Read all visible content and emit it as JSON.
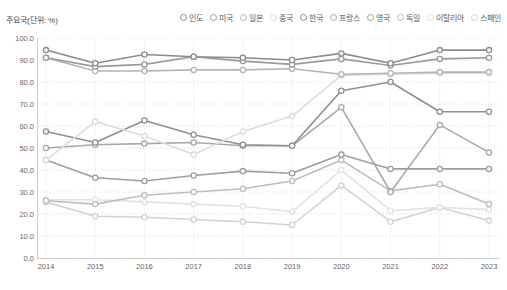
{
  "chart_title": "주요국(단위: %)",
  "legend": {
    "position": "top-right",
    "entries": [
      {
        "label": "인도",
        "color": "#8c8c8c"
      },
      {
        "label": "미국",
        "color": "#9a9a9a"
      },
      {
        "label": "일본",
        "color": "#b4b4b4"
      },
      {
        "label": "중국",
        "color": "#dcdcdc"
      },
      {
        "label": "한국",
        "color": "#8f8f8f"
      },
      {
        "label": "프랑스",
        "color": "#a8a8a8"
      },
      {
        "label": "영국",
        "color": "#9e9e9e"
      },
      {
        "label": "독일",
        "color": "#bdbdbd"
      },
      {
        "label": "이탈리아",
        "color": "#e2e2e2"
      },
      {
        "label": "스페인",
        "color": "#d2d2d2"
      }
    ]
  },
  "chart_data": {
    "type": "line",
    "title": "주요국(단위: %)",
    "xlabel": "",
    "ylabel": "",
    "ylim": [
      0,
      100
    ],
    "yticks": [
      "100.0",
      "90.0",
      "80.0",
      "70.0",
      "60.0",
      "50.0",
      "40.0",
      "30.0",
      "20.0",
      "10.0",
      "0.0"
    ],
    "grid": true,
    "categories": [
      "2014",
      "2015",
      "2016",
      "2017",
      "2018",
      "2019",
      "2020",
      "2021",
      "2022",
      "2023"
    ],
    "x": [
      2014,
      2015,
      2016,
      2017,
      2018,
      2019,
      2020,
      2021,
      2022,
      2023
    ],
    "series": [
      {
        "name": "인도",
        "color": "#8c8c8c",
        "values": [
          94.5,
          88.5,
          92.5,
          91.5,
          91.0,
          90.0,
          93.0,
          88.5,
          94.5,
          94.5
        ]
      },
      {
        "name": "미국",
        "color": "#9a9a9a",
        "values": [
          91.0,
          87.0,
          88.0,
          91.5,
          89.5,
          88.0,
          90.5,
          87.5,
          90.5,
          91.0
        ]
      },
      {
        "name": "일본",
        "color": "#b4b4b4",
        "values": [
          91.0,
          85.0,
          85.0,
          85.5,
          85.5,
          86.0,
          83.5,
          84.0,
          84.5,
          84.5
        ]
      },
      {
        "name": "중국",
        "color": "#dcdcdc",
        "values": [
          44.5,
          62.0,
          55.5,
          47.0,
          57.5,
          64.5,
          83.0,
          83.5,
          84.0,
          84.0
        ]
      },
      {
        "name": "한국",
        "color": "#8f8f8f",
        "values": [
          57.5,
          52.5,
          62.5,
          56.0,
          51.5,
          51.0,
          76.0,
          80.0,
          66.5,
          66.5
        ]
      },
      {
        "name": "프랑스",
        "color": "#a8a8a8",
        "values": [
          50.0,
          51.5,
          52.0,
          52.5,
          51.0,
          51.0,
          68.5,
          30.0,
          60.5,
          48.0
        ]
      },
      {
        "name": "영국",
        "color": "#9e9e9e",
        "values": [
          44.5,
          36.5,
          35.0,
          37.5,
          39.5,
          38.5,
          47.0,
          40.5,
          40.5,
          40.5
        ]
      },
      {
        "name": "독일",
        "color": "#bdbdbd",
        "values": [
          26.0,
          24.5,
          28.5,
          30.0,
          31.5,
          35.0,
          44.5,
          30.5,
          33.5,
          24.5
        ]
      },
      {
        "name": "이탈리아",
        "color": "#e2e2e2",
        "values": [
          26.5,
          26.5,
          25.5,
          24.5,
          23.5,
          21.0,
          40.0,
          21.5,
          23.0,
          22.0
        ]
      },
      {
        "name": "스페인",
        "color": "#d2d2d2",
        "values": [
          25.5,
          19.0,
          18.5,
          17.5,
          16.5,
          15.0,
          33.0,
          16.5,
          23.0,
          17.0
        ]
      }
    ]
  }
}
